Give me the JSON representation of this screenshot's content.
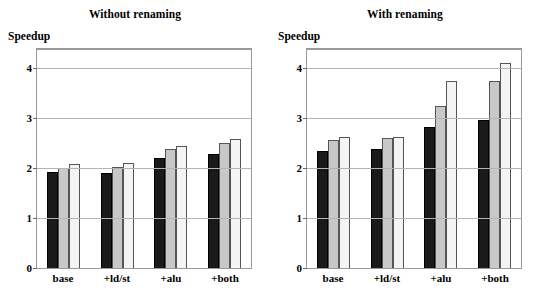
{
  "chart_data": [
    {
      "type": "bar",
      "title": "Without renaming",
      "xlabel": "",
      "ylabel": "Speedup",
      "categories": [
        "base",
        "+ld/st",
        "+alu",
        "+both"
      ],
      "series": [
        {
          "name": "series-1-dark",
          "color": "#1a1a1a",
          "values": [
            1.91,
            1.9,
            2.2,
            2.28
          ]
        },
        {
          "name": "series-2-gray",
          "color": "#c8c8c8",
          "values": [
            1.99,
            2.02,
            2.37,
            2.5
          ]
        },
        {
          "name": "series-3-light",
          "color": "#f4f4f4",
          "values": [
            2.07,
            2.09,
            2.43,
            2.57
          ]
        }
      ],
      "ylim": [
        0,
        4.35
      ],
      "yticks": [
        0,
        1,
        2,
        3,
        4
      ],
      "ytick_labels": [
        "0",
        "1",
        "2",
        "3",
        "4"
      ],
      "grid": true,
      "legend": "none"
    },
    {
      "type": "bar",
      "title": "With renaming",
      "xlabel": "",
      "ylabel": "Speedup",
      "categories": [
        "base",
        "+ld/st",
        "+alu",
        "+both"
      ],
      "series": [
        {
          "name": "series-1-dark",
          "color": "#1a1a1a",
          "values": [
            2.34,
            2.38,
            2.82,
            2.96
          ]
        },
        {
          "name": "series-2-gray",
          "color": "#c8c8c8",
          "values": [
            2.55,
            2.59,
            3.24,
            3.74
          ]
        },
        {
          "name": "series-3-light",
          "color": "#f4f4f4",
          "values": [
            2.61,
            2.62,
            3.73,
            4.09
          ]
        }
      ],
      "ylim": [
        0,
        4.35
      ],
      "yticks": [
        0,
        1,
        2,
        3,
        4
      ],
      "ytick_labels": [
        "0",
        "1",
        "2",
        "3",
        "4"
      ],
      "grid": true,
      "legend": "none"
    }
  ],
  "panels": [
    {
      "title": "Without renaming",
      "ylabel": "Speedup",
      "ytick_labels": [
        "4",
        "3",
        "2",
        "1",
        "0"
      ],
      "xlabels": [
        "base",
        "+ld/st",
        "+alu",
        "+both"
      ]
    },
    {
      "title": "With renaming",
      "ylabel": "Speedup",
      "ytick_labels": [
        "4",
        "3",
        "2",
        "1",
        "0"
      ],
      "xlabels": [
        "base",
        "+ld/st",
        "+alu",
        "+both"
      ]
    }
  ]
}
